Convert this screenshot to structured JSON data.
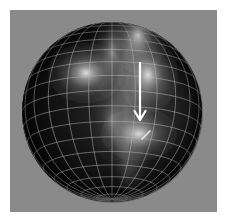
{
  "figure": {
    "width": 227,
    "height": 222,
    "frame_color": "#ffffff",
    "panel_color": "#8a8a8a",
    "title": "",
    "caption": ""
  },
  "panel": {
    "x": 10,
    "y": 10,
    "width": 207,
    "height": 202,
    "background_color": "#8a8a8a"
  },
  "sphere": {
    "label": "wireframe-sphere",
    "center_x": 112,
    "center_y": 112,
    "radius": 90,
    "surface_color_dark": "#0a0a0a",
    "surface_color_mid": "#2a2a2a",
    "mesh_color": "#b9b9b9",
    "meridian_count": 24,
    "parallel_count": 18,
    "projection": "orthographic"
  },
  "hotspots": [
    {
      "name": "glow-upper-right",
      "cx": 138,
      "cy": 35,
      "rx": 16,
      "ry": 20,
      "intensity": 0.95
    },
    {
      "name": "glow-left-center",
      "cx": 86,
      "cy": 73,
      "rx": 20,
      "ry": 16,
      "intensity": 0.9
    },
    {
      "name": "glow-right-center",
      "cx": 148,
      "cy": 75,
      "rx": 16,
      "ry": 20,
      "intensity": 0.88
    },
    {
      "name": "glow-lower-right",
      "cx": 139,
      "cy": 134,
      "rx": 20,
      "ry": 14,
      "intensity": 0.85
    },
    {
      "name": "glow-band-upper",
      "cx": 112,
      "cy": 52,
      "rx": 11,
      "ry": 26,
      "intensity": 0.45
    },
    {
      "name": "glow-band-lower",
      "cx": 112,
      "cy": 120,
      "rx": 11,
      "ry": 22,
      "intensity": 0.35
    }
  ],
  "annotations": {
    "arrow": {
      "name": "downward-arrow",
      "color": "#ffffff",
      "x1": 140,
      "y1": 62,
      "x2": 140,
      "y2": 120,
      "head_width": 11,
      "head_length": 9,
      "line_width": 2.2,
      "direction": "down",
      "label": ""
    },
    "tick": {
      "name": "diagonal-tick-mark",
      "color": "#e8e8e8",
      "x1": 142,
      "y1": 139,
      "x2": 150,
      "y2": 131,
      "line_width": 1.6,
      "label": ""
    }
  },
  "axes": {
    "visible": false,
    "xlabel": "",
    "ylabel": "",
    "ticks": []
  },
  "chart_data": {
    "type": "heatmap",
    "title": "",
    "subtitle": "",
    "xlabel": "",
    "ylabel": "",
    "grid": true,
    "legend": "none",
    "geometry": {
      "shape": "sphere",
      "center": [
        112,
        112
      ],
      "radius": 90,
      "meridians": 24,
      "parallels": 18
    },
    "hotspot_positions": [
      [
        138,
        35
      ],
      [
        86,
        73
      ],
      [
        148,
        75
      ],
      [
        139,
        134
      ],
      [
        112,
        52
      ],
      [
        112,
        120
      ]
    ],
    "hotspot_intensities": [
      0.95,
      0.9,
      0.88,
      0.85,
      0.45,
      0.35
    ],
    "annotation_vectors": [
      {
        "from": [
          140,
          62
        ],
        "to": [
          140,
          120
        ],
        "style": "arrow"
      },
      {
        "from": [
          142,
          139
        ],
        "to": [
          150,
          131
        ],
        "style": "tick"
      }
    ]
  }
}
